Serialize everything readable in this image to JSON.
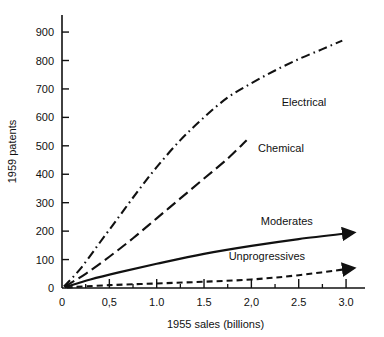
{
  "chart_data": {
    "type": "line",
    "title": "",
    "xlabel": "1955 sales (billions)",
    "ylabel": "1959 patents",
    "xlim": [
      0,
      3.2
    ],
    "ylim": [
      0,
      960
    ],
    "grid": false,
    "legend_position": "inline-annotations",
    "xticks": [
      0,
      0.5,
      1.0,
      1.5,
      2.0,
      2.5,
      3.0
    ],
    "xtick_labels": [
      "0",
      "0,5",
      "1.0",
      "1.5",
      "2,0",
      "2.5",
      "3.0"
    ],
    "xminor_ticks": [
      0.25,
      0.75,
      1.25,
      1.75,
      2.25,
      2.75
    ],
    "yticks": [
      0,
      100,
      200,
      300,
      400,
      500,
      600,
      700,
      800,
      900
    ],
    "ytick_labels": [
      "0",
      "100",
      "200",
      "300",
      "400",
      "500",
      "600",
      "700",
      "800",
      "900"
    ],
    "series": [
      {
        "name": "Electrical",
        "linestyle": "dashdot",
        "arrow": false,
        "color": "#111111",
        "label_x": 2.32,
        "label_y": 640,
        "points": [
          {
            "x": 0.02,
            "y": 5
          },
          {
            "x": 0.2,
            "y": 70
          },
          {
            "x": 0.4,
            "y": 160
          },
          {
            "x": 0.6,
            "y": 250
          },
          {
            "x": 0.8,
            "y": 340
          },
          {
            "x": 1.0,
            "y": 425
          },
          {
            "x": 1.25,
            "y": 520
          },
          {
            "x": 1.5,
            "y": 600
          },
          {
            "x": 1.75,
            "y": 670
          },
          {
            "x": 2.0,
            "y": 720
          },
          {
            "x": 2.25,
            "y": 765
          },
          {
            "x": 2.5,
            "y": 805
          },
          {
            "x": 2.75,
            "y": 840
          },
          {
            "x": 2.96,
            "y": 870
          }
        ]
      },
      {
        "name": "Chemical",
        "linestyle": "dashed",
        "arrow": false,
        "color": "#111111",
        "label_x": 2.07,
        "label_y": 480,
        "points": [
          {
            "x": 0.03,
            "y": 5
          },
          {
            "x": 0.25,
            "y": 50
          },
          {
            "x": 0.5,
            "y": 110
          },
          {
            "x": 0.75,
            "y": 175
          },
          {
            "x": 1.0,
            "y": 245
          },
          {
            "x": 1.25,
            "y": 315
          },
          {
            "x": 1.5,
            "y": 385
          },
          {
            "x": 1.75,
            "y": 455
          },
          {
            "x": 1.95,
            "y": 520
          }
        ]
      },
      {
        "name": "Moderates",
        "linestyle": "solid",
        "arrow": true,
        "color": "#111111",
        "label_x": 2.1,
        "label_y": 222,
        "points": [
          {
            "x": 0.03,
            "y": 3
          },
          {
            "x": 0.3,
            "y": 30
          },
          {
            "x": 0.6,
            "y": 55
          },
          {
            "x": 1.0,
            "y": 85
          },
          {
            "x": 1.5,
            "y": 120
          },
          {
            "x": 2.0,
            "y": 148
          },
          {
            "x": 2.5,
            "y": 172
          },
          {
            "x": 3.08,
            "y": 195
          }
        ]
      },
      {
        "name": "Unprogressives",
        "linestyle": "shortdash",
        "arrow": true,
        "color": "#111111",
        "label_x": 1.76,
        "label_y": 100,
        "points": [
          {
            "x": 0.05,
            "y": 2
          },
          {
            "x": 0.5,
            "y": 10
          },
          {
            "x": 1.0,
            "y": 16
          },
          {
            "x": 1.5,
            "y": 22
          },
          {
            "x": 2.0,
            "y": 30
          },
          {
            "x": 2.5,
            "y": 45
          },
          {
            "x": 3.08,
            "y": 70
          }
        ]
      }
    ]
  }
}
